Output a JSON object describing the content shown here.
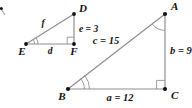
{
  "figure": {
    "stroke_color": "#8d8d8d",
    "vertex_color": "#111111",
    "background_color": "#ffffff"
  },
  "small_triangle": {
    "name": "DEF",
    "vertices": [
      {
        "id": "D",
        "label": "D",
        "x": 74,
        "y": 14
      },
      {
        "id": "E",
        "label": "E",
        "x": 26,
        "y": 44
      },
      {
        "id": "F",
        "label": "F",
        "x": 74,
        "y": 44
      }
    ],
    "sides": [
      {
        "id": "d",
        "label": "d",
        "between": "EF"
      },
      {
        "id": "e",
        "label": "e = 3",
        "between": "DF",
        "value": 3
      },
      {
        "id": "f",
        "label": "f",
        "between": "DE"
      }
    ],
    "angle_marks": [
      {
        "at": "E",
        "type": "double-arc"
      },
      {
        "at": "F",
        "type": "right-angle"
      }
    ]
  },
  "large_triangle": {
    "name": "ABC",
    "vertices": [
      {
        "id": "A",
        "label": "A",
        "x": 165,
        "y": 14
      },
      {
        "id": "B",
        "label": "B",
        "x": 68,
        "y": 89
      },
      {
        "id": "C",
        "label": "C",
        "x": 165,
        "y": 89
      }
    ],
    "sides": [
      {
        "id": "a",
        "label": "a = 12",
        "between": "BC",
        "value": 12
      },
      {
        "id": "b",
        "label": "b = 9",
        "between": "AC",
        "value": 9
      },
      {
        "id": "c",
        "label": "c = 15",
        "between": "AB",
        "value": 15
      }
    ],
    "angle_marks": [
      {
        "at": "A",
        "type": "single-arc"
      },
      {
        "at": "B",
        "type": "double-arc"
      },
      {
        "at": "C",
        "type": "right-angle"
      }
    ]
  },
  "labels": {
    "D": "D",
    "E": "E",
    "F": "F",
    "A": "A",
    "B": "B",
    "C": "C",
    "d": "d",
    "e": "e = 3",
    "f": "f",
    "a": "a = 12",
    "b": "b = 9",
    "c": "c = 15"
  }
}
